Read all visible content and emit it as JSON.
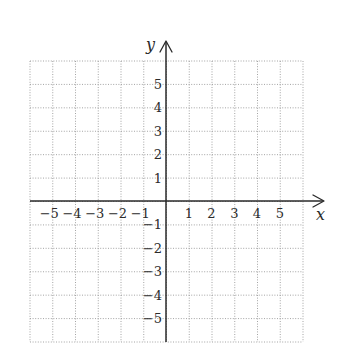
{
  "diagram": {
    "type": "cartesian-coordinate-grid",
    "axes": {
      "x": {
        "label": "x",
        "min": -6,
        "max": 6,
        "ticks": [
          -5,
          -4,
          -3,
          -2,
          -1,
          1,
          2,
          3,
          4,
          5
        ]
      },
      "y": {
        "label": "y",
        "min": -6,
        "max": 6,
        "ticks": [
          5,
          4,
          3,
          2,
          1,
          -1,
          -2,
          -3,
          -4,
          -5
        ]
      }
    },
    "x_tick_labels": [
      "−5",
      "−4",
      "−3",
      "−2",
      "−1",
      "1",
      "2",
      "3",
      "4",
      "5"
    ],
    "y_tick_labels": [
      "5",
      "4",
      "3",
      "2",
      "1",
      "−1",
      "−2",
      "−3",
      "−4",
      "−5"
    ],
    "grid": {
      "style": "dotted",
      "columns": 12,
      "rows": 12,
      "color": "#9a9a9a"
    },
    "axis_color": "#2a2a2a",
    "arrows": [
      "x-positive",
      "y-positive"
    ]
  }
}
